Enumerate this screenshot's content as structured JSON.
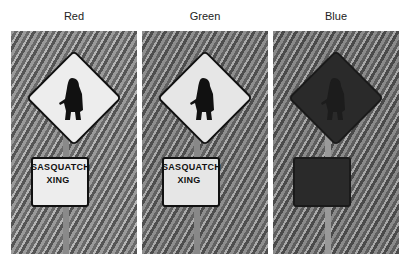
{
  "panels": [
    {
      "label": "Red",
      "sign_text_line1": "SASQUATCH",
      "sign_text_line2": "XING",
      "sign_face_color": "#ededed",
      "sign_border_color": "#111111",
      "text_color": "#111111",
      "bg_light": "#9a9a9a",
      "bg_dark": "#555555"
    },
    {
      "label": "Green",
      "sign_text_line1": "SASQUATCH",
      "sign_text_line2": "XING",
      "sign_face_color": "#e6e6e6",
      "sign_border_color": "#111111",
      "text_color": "#111111",
      "bg_light": "#8e8e8e",
      "bg_dark": "#4e4e4e"
    },
    {
      "label": "Blue",
      "sign_text_line1": "",
      "sign_text_line2": "",
      "sign_face_color": "#2a2a2a",
      "sign_border_color": "#1a1a1a",
      "text_color": "#222222",
      "bg_light": "#8a8a8a",
      "bg_dark": "#4a4a4a"
    }
  ]
}
